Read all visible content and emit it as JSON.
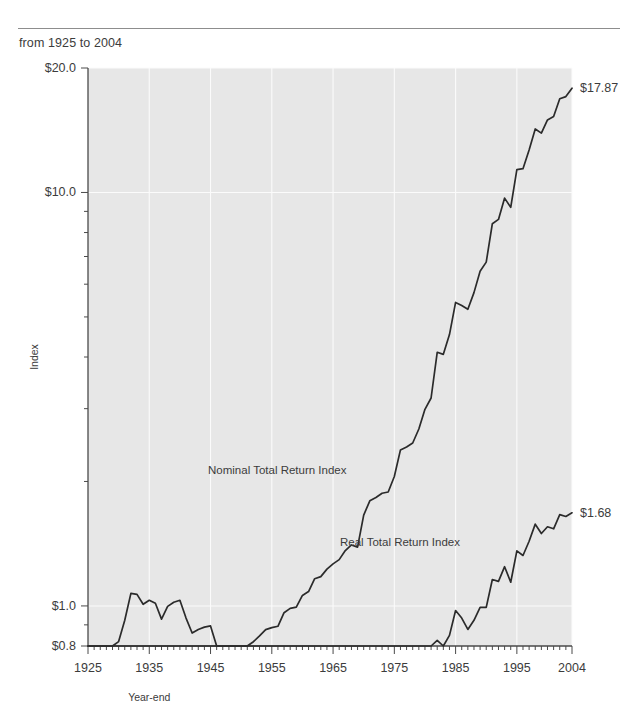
{
  "header": {
    "subtitle": "from 1925 to 2004"
  },
  "chart_data": {
    "type": "line",
    "title": "",
    "subtitle": "from 1925 to 2004",
    "xlabel": "Year-end",
    "ylabel": "Index",
    "yscale": "log",
    "ylim": [
      0.8,
      20.0
    ],
    "xlim": [
      1925,
      2004
    ],
    "grid": true,
    "legend_position": "inline-annotation",
    "y_tick_labels": [
      "$20.0",
      "$10.0",
      "$1.0",
      "$0.8"
    ],
    "y_tick_values": [
      20.0,
      10.0,
      1.0,
      0.8
    ],
    "x_tick_labels": [
      "1925",
      "1935",
      "1945",
      "1955",
      "1965",
      "1975",
      "1985",
      "1995",
      "2004"
    ],
    "x_tick_values": [
      1925,
      1935,
      1945,
      1955,
      1965,
      1975,
      1985,
      1995,
      2004
    ],
    "annotations": [
      {
        "name": "nominal-end-value",
        "text": "$17.87",
        "x": 2004,
        "y": 17.87
      },
      {
        "name": "real-end-value",
        "text": "$1.68",
        "x": 2004,
        "y": 1.68
      }
    ],
    "series": [
      {
        "name": "Nominal Total Return Index",
        "label": "Nominal Total Return Index",
        "color": "#2b2b2b",
        "end_value": 17.87,
        "x": [
          1925,
          1926,
          1927,
          1928,
          1929,
          1930,
          1931,
          1932,
          1933,
          1934,
          1935,
          1936,
          1937,
          1938,
          1939,
          1940,
          1941,
          1942,
          1943,
          1944,
          1945,
          1946,
          1947,
          1948,
          1949,
          1950,
          1951,
          1952,
          1953,
          1954,
          1955,
          1956,
          1957,
          1958,
          1959,
          1960,
          1961,
          1962,
          1963,
          1964,
          1965,
          1966,
          1967,
          1968,
          1969,
          1970,
          1971,
          1972,
          1973,
          1974,
          1975,
          1976,
          1977,
          1978,
          1979,
          1980,
          1981,
          1982,
          1983,
          1984,
          1985,
          1986,
          1987,
          1988,
          1989,
          1990,
          1991,
          1992,
          1993,
          1994,
          1995,
          1996,
          1997,
          1998,
          1999,
          2000,
          2001,
          2002,
          2003,
          2004
        ],
        "y": [
          1.0,
          1.08,
          1.17,
          1.18,
          1.22,
          1.27,
          1.25,
          1.39,
          1.39,
          1.51,
          1.57,
          1.68,
          1.63,
          1.74,
          1.81,
          1.87,
          1.88,
          1.94,
          2.0,
          2.06,
          2.13,
          2.14,
          2.16,
          2.23,
          2.3,
          2.35,
          2.39,
          2.45,
          2.53,
          2.62,
          2.65,
          2.67,
          2.88,
          2.95,
          2.97,
          3.17,
          3.24,
          3.48,
          3.52,
          3.67,
          3.78,
          3.87,
          4.07,
          4.2,
          4.15,
          4.96,
          5.37,
          5.47,
          5.6,
          5.64,
          6.15,
          7.13,
          7.25,
          7.41,
          8.01,
          8.94,
          9.52,
          12.28,
          12.14,
          13.55,
          16.21,
          15.94,
          15.6,
          17.12,
          19.28,
          20.29,
          25.13,
          25.74,
          28.98,
          27.52,
          33.96,
          34.14,
          37.89,
          42.59,
          41.62,
          44.8,
          45.67,
          50.39,
          51.0,
          53.44
        ],
        "note": "values rescaled to end at 17.87 on chart"
      },
      {
        "name": "Real Total Return Index",
        "label": "Real Total Return Index",
        "color": "#2b2b2b",
        "end_value": 1.68,
        "x": [
          1925,
          1926,
          1927,
          1928,
          1929,
          1930,
          1931,
          1932,
          1933,
          1934,
          1935,
          1936,
          1937,
          1938,
          1939,
          1940,
          1941,
          1942,
          1943,
          1944,
          1945,
          1946,
          1947,
          1948,
          1949,
          1950,
          1951,
          1952,
          1953,
          1954,
          1955,
          1956,
          1957,
          1958,
          1959,
          1960,
          1961,
          1962,
          1963,
          1964,
          1965,
          1966,
          1967,
          1968,
          1969,
          1970,
          1971,
          1972,
          1973,
          1974,
          1975,
          1976,
          1977,
          1978,
          1979,
          1980,
          1981,
          1982,
          1983,
          1984,
          1985,
          1986,
          1987,
          1988,
          1989,
          1990,
          1991,
          1992,
          1993,
          1994,
          1995,
          1996,
          1997,
          1998,
          1999,
          2000,
          2001,
          2002,
          2003,
          2004
        ],
        "y": [
          1.0,
          1.09,
          1.21,
          1.24,
          1.3,
          1.43,
          1.61,
          1.87,
          1.86,
          1.76,
          1.8,
          1.77,
          1.62,
          1.74,
          1.78,
          1.8,
          1.63,
          1.5,
          1.53,
          1.55,
          1.56,
          1.35,
          1.17,
          1.12,
          1.14,
          1.07,
          0.99,
          1.01,
          1.04,
          1.08,
          1.07,
          1.05,
          1.1,
          1.11,
          1.1,
          1.15,
          1.16,
          1.23,
          1.22,
          1.25,
          1.26,
          1.24,
          1.27,
          1.27,
          1.2,
          1.24,
          1.3,
          1.29,
          1.25,
          1.15,
          1.18,
          1.28,
          1.22,
          1.17,
          1.18,
          1.2,
          1.18,
          1.44,
          1.38,
          1.48,
          1.7,
          1.63,
          1.53,
          1.61,
          1.73,
          1.73,
          2.02,
          2.0,
          2.17,
          1.99,
          2.37,
          2.31,
          2.5,
          2.75,
          2.61,
          2.71,
          2.68,
          2.9,
          2.87,
          2.93
        ],
        "note": "values rescaled to end at 1.68 on chart"
      }
    ]
  },
  "axes": {
    "x_title": "Year-end",
    "y_title": "Index"
  }
}
